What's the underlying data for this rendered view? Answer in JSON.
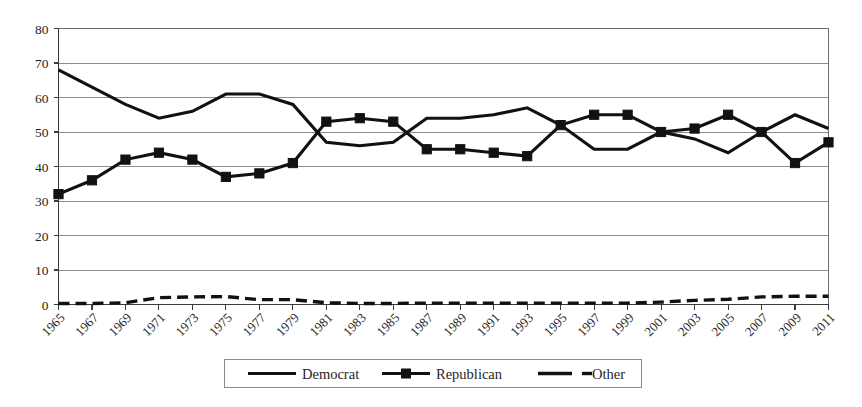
{
  "chart_data": {
    "type": "line",
    "title": "",
    "subtitle": "",
    "xlabel": "",
    "ylabel": "",
    "ylim": [
      0,
      80
    ],
    "ytick_step": 10,
    "yticks": [
      0,
      10,
      20,
      30,
      40,
      50,
      60,
      70,
      80
    ],
    "ytick_labels": [
      "0",
      "10",
      "20",
      "30",
      "40",
      "50",
      "60",
      "70",
      "80"
    ],
    "grid": true,
    "grid_axis": "y",
    "legend_position": "bottom",
    "x": [
      1965,
      1967,
      1969,
      1971,
      1973,
      1975,
      1977,
      1979,
      1981,
      1983,
      1985,
      1987,
      1989,
      1991,
      1993,
      1995,
      1997,
      1999,
      2001,
      2003,
      2005,
      2007,
      2009,
      2011
    ],
    "xtick_labels": [
      "1965",
      "1967",
      "1969",
      "1971",
      "1973",
      "1975",
      "1977",
      "1979",
      "1981",
      "1983",
      "1985",
      "1987",
      "1989",
      "1991",
      "1993",
      "1995",
      "1997",
      "1999",
      "2001",
      "2003",
      "2005",
      "2007",
      "2009",
      "2011"
    ],
    "series": [
      {
        "name": "Democrat",
        "marker": "none",
        "dash": "solid",
        "color": "#111111",
        "values": [
          68,
          63,
          58,
          54,
          56,
          61,
          61,
          58,
          47,
          46,
          47,
          54,
          54,
          55,
          57,
          52,
          45,
          45,
          50,
          48,
          44,
          50,
          55,
          51
        ]
      },
      {
        "name": "Republican",
        "marker": "square",
        "dash": "solid",
        "color": "#111111",
        "values": [
          32,
          36,
          42,
          44,
          42,
          37,
          38,
          41,
          53,
          54,
          53,
          45,
          45,
          44,
          43,
          52,
          55,
          55,
          50,
          51,
          55,
          50,
          41,
          47
        ]
      },
      {
        "name": "Other",
        "marker": "none",
        "dash": "dashed",
        "color": "#111111",
        "values": [
          0.3,
          0.3,
          0.5,
          2,
          2.2,
          2.3,
          1.4,
          1.4,
          0.5,
          0.3,
          0.3,
          0.4,
          0.4,
          0.4,
          0.4,
          0.4,
          0.4,
          0.4,
          0.7,
          1.2,
          1.5,
          2.2,
          2.4,
          2.4
        ]
      }
    ]
  },
  "legend": {
    "entries": [
      {
        "label": "Democrat"
      },
      {
        "label": "Republican"
      },
      {
        "label": "Other"
      }
    ]
  }
}
